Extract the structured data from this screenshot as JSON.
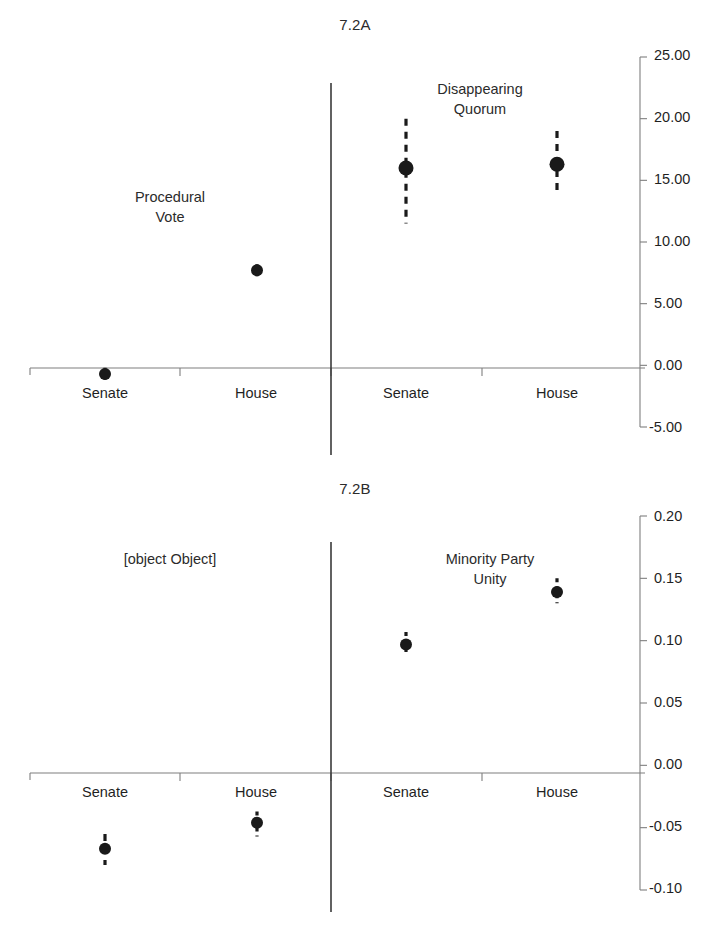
{
  "figures": [
    {
      "id": "7.2A",
      "title": "7.2A",
      "annotations": [
        {
          "name": "procedural-vote-label",
          "text": "Procedural\nVote"
        },
        {
          "name": "disappearing-quorum-label",
          "text": "Disappearing\nQuorum"
        }
      ],
      "category_labels": [
        "Senate",
        "House",
        "Senate",
        "House"
      ],
      "ytick_labels": [
        "25.00",
        "20.00",
        "15.00",
        "10.00",
        "5.00",
        "0.00",
        "-5.00"
      ]
    },
    {
      "id": "7.2B",
      "title": "7.2B",
      "annotations": [
        {
          "name": "date-rank-label",
          "text": "Date Rank"
        },
        {
          "name": "minority-party-unity-label",
          "text": "Minority Party\nUnity"
        }
      ],
      "category_labels": [
        "Senate",
        "House",
        "Senate",
        "House"
      ],
      "ytick_labels": [
        "0.20",
        "0.15",
        "0.10",
        "0.05",
        "0.00",
        "-0.05",
        "-0.10"
      ]
    }
  ],
  "chart_data": [
    {
      "type": "scatter",
      "title": "7.2A",
      "xlabel": "",
      "ylabel": "",
      "ylim": [
        -5.0,
        25.0
      ],
      "yticks": [
        -5.0,
        0.0,
        5.0,
        10.0,
        15.0,
        20.0,
        25.0
      ],
      "ytick_labels": [
        "-5.00",
        "0.00",
        "5.00",
        "10.00",
        "15.00",
        "20.00",
        "25.00"
      ],
      "grid": false,
      "legend": "none",
      "zero_line": 0.0,
      "group_labels": [
        "Procedural Vote",
        "Disappearing Quorum"
      ],
      "categories": [
        "Senate",
        "House",
        "Senate",
        "House"
      ],
      "values": [
        -0.7,
        7.7,
        16.0,
        16.3
      ],
      "ci_low": [
        -1.2,
        7.2,
        11.5,
        14.0
      ],
      "ci_high": [
        -0.2,
        8.2,
        20.0,
        19.0
      ],
      "points": [
        {
          "group": "Procedural Vote",
          "chamber": "Senate",
          "estimate": -0.7,
          "ci_low": -1.2,
          "ci_high": -0.2
        },
        {
          "group": "Procedural Vote",
          "chamber": "House",
          "estimate": 7.7,
          "ci_low": 7.2,
          "ci_high": 8.2
        },
        {
          "group": "Disappearing Quorum",
          "chamber": "Senate",
          "estimate": 16.0,
          "ci_low": 11.5,
          "ci_high": 20.0
        },
        {
          "group": "Disappearing Quorum",
          "chamber": "House",
          "estimate": 16.3,
          "ci_low": 14.0,
          "ci_high": 19.0
        }
      ]
    },
    {
      "type": "scatter",
      "title": "7.2B",
      "xlabel": "",
      "ylabel": "",
      "ylim": [
        -0.1,
        0.2
      ],
      "yticks": [
        -0.1,
        -0.05,
        0.0,
        0.05,
        0.1,
        0.15,
        0.2
      ],
      "ytick_labels": [
        "-0.10",
        "-0.05",
        "0.00",
        "0.05",
        "0.10",
        "0.15",
        "0.20"
      ],
      "grid": false,
      "legend": "none",
      "zero_line": 0.0,
      "group_labels": [
        "Date Rank",
        "Minority Party Unity"
      ],
      "categories": [
        "Senate",
        "House",
        "Senate",
        "House"
      ],
      "values": [
        -0.067,
        -0.046,
        0.097,
        0.139
      ],
      "ci_low": [
        -0.08,
        -0.057,
        0.088,
        0.13
      ],
      "ci_high": [
        -0.055,
        -0.037,
        0.107,
        0.15
      ],
      "points": [
        {
          "group": "Date Rank",
          "chamber": "Senate",
          "estimate": -0.067,
          "ci_low": -0.08,
          "ci_high": -0.055
        },
        {
          "group": "Date Rank",
          "chamber": "House",
          "estimate": -0.046,
          "ci_low": -0.057,
          "ci_high": -0.037
        },
        {
          "group": "Minority Party Unity",
          "chamber": "Senate",
          "estimate": 0.097,
          "ci_low": 0.088,
          "ci_high": 0.107
        },
        {
          "group": "Minority Party Unity",
          "chamber": "House",
          "estimate": 0.139,
          "ci_low": 0.13,
          "ci_high": 0.15
        }
      ]
    }
  ],
  "style": {
    "marker_color": "#1a1a1a",
    "axis_color": "#7f7f7f",
    "divider_color": "#3a3a3a",
    "text_color": "#1f1f1f",
    "background": "#ffffff"
  }
}
